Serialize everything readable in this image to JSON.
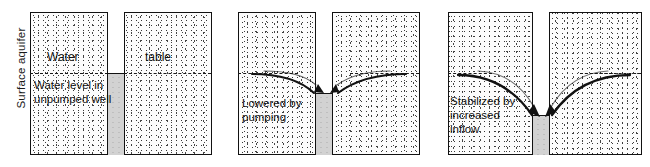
{
  "figure": {
    "axis_label": "Surface aquifer",
    "panel_count": 3
  },
  "panels": [
    {
      "id": "unpumped",
      "labels": {
        "left_top": "Water",
        "right_top": "table",
        "left_body": "Water level in\nunpumped well"
      },
      "well_water_level_label": "at water table",
      "has_drawdown_curves": false
    },
    {
      "id": "pumping",
      "labels": {
        "left_body": "Lowered by\npumping"
      },
      "well_water_level_label": "lowered",
      "has_drawdown_curves": true
    },
    {
      "id": "stabilized",
      "labels": {
        "left_body": "Stabilized by\nincreased\ninflow"
      },
      "well_water_level_label": "stabilized low",
      "has_drawdown_curves": true
    }
  ],
  "colors": {
    "ink": "#111111",
    "stipple": "#2e2e2e",
    "well_water": "#d2d2d2",
    "background": "#ffffff"
  }
}
